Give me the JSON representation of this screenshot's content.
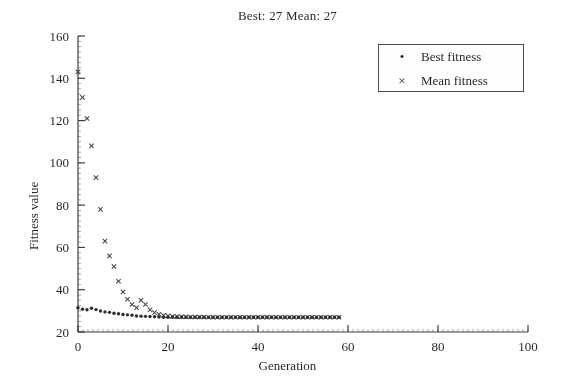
{
  "chart_data": {
    "type": "scatter",
    "title": "Best: 27 Mean: 27",
    "xlabel": "Generation",
    "ylabel": "Fitness value",
    "xlim": [
      0,
      100
    ],
    "ylim": [
      20,
      160
    ],
    "xticks": [
      0,
      20,
      40,
      60,
      80,
      100
    ],
    "yticks": [
      20,
      40,
      60,
      80,
      100,
      120,
      140,
      160
    ],
    "grid": false,
    "legend_position": "top-right",
    "legend": [
      "Best fitness",
      "Mean fitness"
    ],
    "series": [
      {
        "name": "Best fitness",
        "marker": "dot",
        "color": "#151515",
        "x": [
          0,
          1,
          2,
          3,
          4,
          5,
          6,
          7,
          8,
          9,
          10,
          11,
          12,
          13,
          14,
          15,
          16,
          17,
          18,
          19,
          20,
          21,
          22,
          23,
          24,
          25,
          26,
          27,
          28,
          29,
          30,
          31,
          32,
          33,
          34,
          35,
          36,
          37,
          38,
          39,
          40,
          41,
          42,
          43,
          44,
          45,
          46,
          47,
          48,
          49,
          50,
          51,
          52,
          53,
          54,
          55,
          56,
          57,
          58
        ],
        "y": [
          31.5,
          30.8,
          30.5,
          31.2,
          30.6,
          29.9,
          29.5,
          29.3,
          28.9,
          28.6,
          28.3,
          28.1,
          27.9,
          27.6,
          27.5,
          27.4,
          27.3,
          27.2,
          27.1,
          27.0,
          27.0,
          27.0,
          27.0,
          27.0,
          27.0,
          27.0,
          27.0,
          27.0,
          27.0,
          27.0,
          27.0,
          27.0,
          27.0,
          27.0,
          27.0,
          27.0,
          27.0,
          27.0,
          27.0,
          27.0,
          27.0,
          27.0,
          27.0,
          27.0,
          27.0,
          27.0,
          27.0,
          27.0,
          27.0,
          27.0,
          27.0,
          27.0,
          27.0,
          27.0,
          27.0,
          27.0,
          27.0,
          27.0,
          27.0
        ]
      },
      {
        "name": "Mean fitness",
        "marker": "cross",
        "color": "#2a2a2a",
        "x": [
          0,
          1,
          2,
          3,
          4,
          5,
          6,
          7,
          8,
          9,
          10,
          11,
          12,
          13,
          14,
          15,
          16,
          17,
          18,
          19,
          20,
          21,
          22,
          23,
          24,
          25,
          26,
          27,
          28,
          29,
          30,
          31,
          32,
          33,
          34,
          35,
          36,
          37,
          38,
          39,
          40,
          41,
          42,
          43,
          44,
          45,
          46,
          47,
          48,
          49,
          50,
          51,
          52,
          53,
          54,
          55,
          56,
          57,
          58
        ],
        "y": [
          143.0,
          131.0,
          121.0,
          108.0,
          93.0,
          78.0,
          63.0,
          56.0,
          51.0,
          44.0,
          39.0,
          35.5,
          33.0,
          31.5,
          35.0,
          33.0,
          30.5,
          29.2,
          28.4,
          27.9,
          27.6,
          27.4,
          27.3,
          27.2,
          27.2,
          27.1,
          27.1,
          27.1,
          27.1,
          27.0,
          27.0,
          27.0,
          27.0,
          27.0,
          27.0,
          27.0,
          27.0,
          27.0,
          27.0,
          27.0,
          27.0,
          27.0,
          27.0,
          27.0,
          27.0,
          27.0,
          27.0,
          27.0,
          27.0,
          27.0,
          27.0,
          27.0,
          27.0,
          27.0,
          27.0,
          27.0,
          27.0,
          27.0,
          27.0
        ]
      }
    ]
  },
  "legend_markers": {
    "best": "•",
    "mean": "×"
  },
  "colors": {
    "axis": "#3a3a3a",
    "text": "#1f1f1f",
    "background": "#ffffff"
  }
}
